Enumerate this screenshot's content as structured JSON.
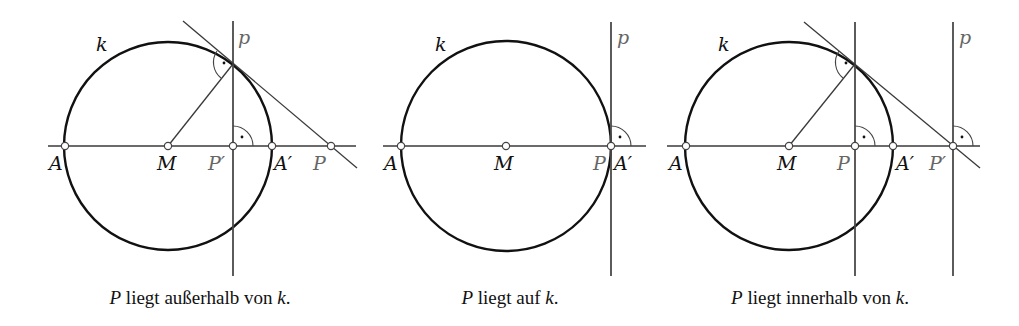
{
  "figure": {
    "panels": [
      {
        "id": "outside",
        "caption": {
          "var": "P",
          "text": " liegt außerhalb von ",
          "circle_var": "k",
          "end": "."
        },
        "labels": {
          "k": "k",
          "p": "p",
          "A": "A",
          "M": "M",
          "P_prime": "P′",
          "A_prime": "A′",
          "P": "P"
        }
      },
      {
        "id": "on",
        "caption": {
          "var": "P",
          "text": " liegt auf ",
          "circle_var": "k",
          "end": "."
        },
        "labels": {
          "k": "k",
          "p": "p",
          "A": "A",
          "M": "M",
          "P": "P",
          "A_prime": "A′"
        }
      },
      {
        "id": "inside",
        "caption": {
          "var": "P",
          "text": " liegt innerhalb von ",
          "circle_var": "k",
          "end": "."
        },
        "labels": {
          "k": "k",
          "p": "p",
          "A": "A",
          "M": "M",
          "P": "P",
          "A_prime": "A′",
          "P_prime": "P′"
        }
      }
    ],
    "colors": {
      "circle": "#111111",
      "lines": "#3a3a3a",
      "gray_labels": "#666666",
      "background": "#ffffff"
    }
  }
}
